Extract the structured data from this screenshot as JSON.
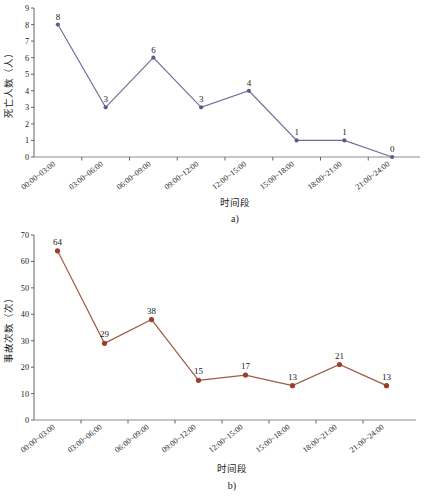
{
  "figures": [
    {
      "caption": "a)",
      "xlabel": "时间段",
      "ylabel": "死亡人数（人）"
    },
    {
      "caption": "b)",
      "xlabel": "时间段",
      "ylabel": "事故次数（次）"
    }
  ],
  "chart_data": [
    {
      "type": "line",
      "title": "",
      "caption": "a)",
      "xlabel": "时间段",
      "ylabel": "死亡人数（人）",
      "categories": [
        "00:00~03:00",
        "03:00~06:00",
        "06:00~09:00",
        "09:00~12:00",
        "12:00~15:00",
        "15:00~18:00",
        "18:00~21:00",
        "21:00~24:00"
      ],
      "values": [
        8,
        3,
        6,
        3,
        4,
        1,
        1,
        0
      ],
      "point_labels": [
        "8",
        "3",
        "6",
        "3",
        "4",
        "1",
        "1",
        "0"
      ],
      "yticks": [
        0,
        1,
        2,
        3,
        4,
        5,
        6,
        7,
        8,
        9
      ],
      "ylim": [
        0,
        9
      ],
      "grid": false,
      "legend": "none",
      "line_color": "#6d6e9e",
      "marker_color": "#5b5c8f"
    },
    {
      "type": "line",
      "title": "",
      "caption": "b)",
      "xlabel": "时间段",
      "ylabel": "事故次数（次）",
      "categories": [
        "00:00~03:00",
        "03:00~06:00",
        "06:00~09:00",
        "09:00~12:00",
        "12:00~15:00",
        "15:00~18:00",
        "18:00~21:00",
        "21:00~24:00"
      ],
      "values": [
        64,
        29,
        38,
        15,
        17,
        13,
        21,
        13
      ],
      "point_labels": [
        "64",
        "29",
        "38",
        "15",
        "17",
        "13",
        "21",
        "13"
      ],
      "yticks": [
        0,
        10,
        20,
        30,
        40,
        50,
        60,
        70
      ],
      "ylim": [
        0,
        70
      ],
      "grid": false,
      "legend": "none",
      "line_color": "#9b5b44",
      "marker_color": "#9b3f29"
    }
  ]
}
